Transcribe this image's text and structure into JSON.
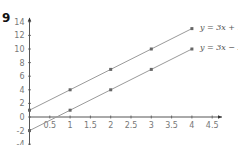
{
  "question_number": "9",
  "chart_data": {
    "type": "line",
    "title": "",
    "xlabel": "",
    "ylabel": "",
    "xlim": [
      0,
      4.6
    ],
    "ylim": [
      -4,
      14.5
    ],
    "grid": false,
    "x_ticks": [
      "0.5",
      "1",
      "1.5",
      "2",
      "2.5",
      "3",
      "3.5",
      "4",
      "4.5"
    ],
    "y_ticks": [
      "-4",
      "-2",
      "0",
      "2",
      "4",
      "6",
      "8",
      "10",
      "12",
      "14"
    ],
    "series": [
      {
        "name": "y = 3x + 1",
        "x": [
          0,
          1,
          2,
          3,
          4
        ],
        "y": [
          1,
          4,
          7,
          10,
          13
        ]
      },
      {
        "name": "y = 3x − 2",
        "x": [
          0,
          1,
          2,
          3,
          4
        ],
        "y": [
          -2,
          1,
          4,
          7,
          10
        ]
      }
    ],
    "legend_position": "inline labels at right end of lines",
    "colors": {
      "line": "#9a9a9a",
      "marker": "#666666",
      "axis": "#555555"
    }
  }
}
